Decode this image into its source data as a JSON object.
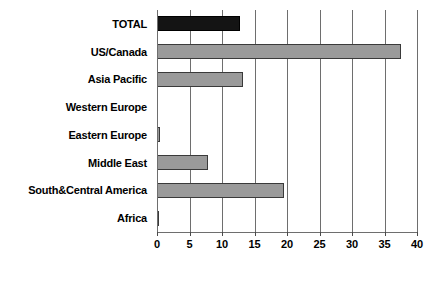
{
  "chart_data": {
    "type": "bar",
    "orientation": "horizontal",
    "title": "",
    "xlabel": "",
    "ylabel": "",
    "xlim": [
      0,
      40
    ],
    "grid": true,
    "legend": "none",
    "xticks": [
      "0",
      "5",
      "10",
      "15",
      "20",
      "25",
      "30",
      "35",
      "40"
    ],
    "xtick_values": [
      0,
      5,
      10,
      15,
      20,
      25,
      30,
      35,
      40
    ],
    "categories": [
      "TOTAL",
      "US/Canada",
      "Asia Pacific",
      "Western Europe",
      "Eastern Europe",
      "Middle East",
      "South&Central America",
      "Africa"
    ],
    "values": [
      12.7,
      37.6,
      13.2,
      0,
      0.4,
      7.8,
      19.5,
      0.3
    ],
    "highlight_index": 0,
    "colors": {
      "bar": "#9a9a9a",
      "bar_total": "#141414",
      "bar_border": "#3a3a3a",
      "axis": "#6e6e6e",
      "text": "#000000",
      "background": "#ffffff"
    }
  }
}
